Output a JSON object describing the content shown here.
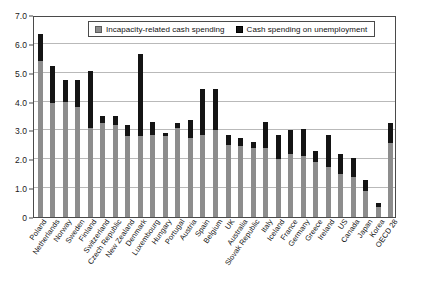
{
  "chart_data": {
    "type": "bar",
    "stacked": true,
    "title": "",
    "subtitle": "",
    "xlabel": "",
    "ylabel": "",
    "ylim": [
      0,
      7.0
    ],
    "ytick_labels": [
      "0",
      "1.0",
      "2.0",
      "3.0",
      "4.0",
      "5.0",
      "6.0",
      "7.0"
    ],
    "ytick_values": [
      0,
      1.0,
      2.0,
      3.0,
      4.0,
      5.0,
      6.0,
      7.0
    ],
    "grid": true,
    "legend_position": "top-center",
    "categories": [
      "Poland",
      "Netherlands",
      "Norway",
      "Sweden",
      "Finland",
      "Switzerland",
      "Czech Republic",
      "New Zealand",
      "Denmark",
      "Luxembourg",
      "Hungary",
      "Portugal",
      "Austria",
      "Spain",
      "Belgium",
      "UK",
      "Australia",
      "Slovak Republic",
      "Italy",
      "Iceland",
      "France",
      "Germany",
      "Greece",
      "Ireland",
      "US",
      "Canada",
      "Japan",
      "Korea",
      "OECD 28"
    ],
    "series": [
      {
        "name": "Incapacity-related cash spending",
        "color": "#8d8d8d",
        "values": [
          5.4,
          3.95,
          4.0,
          3.8,
          3.1,
          3.25,
          3.2,
          2.8,
          2.8,
          2.85,
          2.8,
          3.1,
          2.75,
          2.85,
          3.0,
          2.5,
          2.45,
          2.4,
          2.4,
          2.0,
          2.2,
          2.1,
          1.9,
          1.75,
          1.5,
          1.4,
          0.9,
          0.35,
          2.55
        ]
      },
      {
        "name": "Cash spending on unemployment",
        "color": "#141414",
        "values": [
          0.95,
          1.3,
          0.75,
          0.95,
          1.95,
          0.25,
          0.3,
          0.4,
          2.85,
          0.45,
          0.1,
          0.15,
          0.6,
          1.6,
          1.45,
          0.35,
          0.3,
          0.2,
          0.9,
          0.85,
          0.8,
          0.95,
          0.4,
          1.1,
          0.7,
          0.65,
          0.4,
          0.15,
          0.7
        ]
      }
    ],
    "totals": [
      6.35,
      5.25,
      4.75,
      4.75,
      5.05,
      3.5,
      3.5,
      3.2,
      5.65,
      3.3,
      2.9,
      3.25,
      3.35,
      4.45,
      4.45,
      2.85,
      2.75,
      2.6,
      3.3,
      2.85,
      3.0,
      3.05,
      2.3,
      2.85,
      2.2,
      2.05,
      1.3,
      0.5,
      3.25
    ]
  },
  "legend": {
    "entries": [
      {
        "label": "Incapacity-related cash spending",
        "swatch": "incapacity-swatch-icon"
      },
      {
        "label": "Cash spending on unemployment",
        "swatch": "unemployment-swatch-icon"
      }
    ]
  }
}
